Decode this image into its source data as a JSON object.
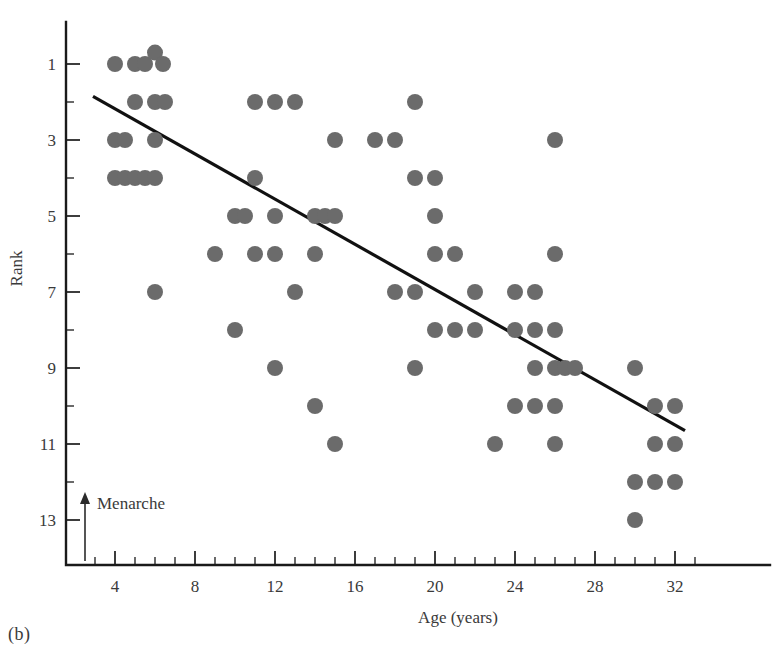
{
  "figure": {
    "panel_caption": "(b)",
    "annotation": {
      "label": "Menarche",
      "age_value": 2.5
    }
  },
  "chart_data": {
    "type": "scatter",
    "title": "",
    "xlabel": "Age (years)",
    "ylabel": "Rank",
    "xlim": [
      1,
      34
    ],
    "ylim": [
      0.2,
      14.2
    ],
    "y_inverted": true,
    "grid": false,
    "legend": null,
    "x_ticks_major": [
      4,
      8,
      12,
      16,
      20,
      24,
      28,
      32
    ],
    "x_ticks_minor": [
      3,
      5,
      6,
      7,
      9,
      10,
      11,
      13,
      14,
      15,
      17,
      18,
      19,
      21,
      22,
      23,
      25,
      26,
      27,
      29,
      30,
      31,
      33
    ],
    "x_tick_labels": [
      "4",
      "8",
      "12",
      "16",
      "20",
      "24",
      "28",
      "32"
    ],
    "y_ticks_major": [
      1,
      3,
      5,
      7,
      9,
      11,
      13
    ],
    "y_ticks_minor": [
      2,
      4,
      6,
      8,
      10,
      12
    ],
    "y_tick_labels": [
      "1",
      "3",
      "5",
      "7",
      "9",
      "11",
      "13"
    ],
    "marker": {
      "shape": "circle",
      "color": "#6b6b6b",
      "radius_px": 8
    },
    "trend_line": {
      "color": "#111111",
      "x_start": 2.9,
      "y_start": 1.85,
      "x_end": 32.5,
      "y_end": 10.65
    },
    "points": [
      {
        "age": 4,
        "rank": 1
      },
      {
        "age": 5,
        "rank": 1
      },
      {
        "age": 5.5,
        "rank": 1
      },
      {
        "age": 6,
        "rank": 0.7
      },
      {
        "age": 6.4,
        "rank": 1
      },
      {
        "age": 5,
        "rank": 2
      },
      {
        "age": 6,
        "rank": 2
      },
      {
        "age": 6.5,
        "rank": 2
      },
      {
        "age": 11,
        "rank": 2
      },
      {
        "age": 12,
        "rank": 2
      },
      {
        "age": 13,
        "rank": 2
      },
      {
        "age": 19,
        "rank": 2
      },
      {
        "age": 4,
        "rank": 3
      },
      {
        "age": 4.5,
        "rank": 3
      },
      {
        "age": 6,
        "rank": 3
      },
      {
        "age": 15,
        "rank": 3
      },
      {
        "age": 17,
        "rank": 3
      },
      {
        "age": 18,
        "rank": 3
      },
      {
        "age": 26,
        "rank": 3
      },
      {
        "age": 4,
        "rank": 4
      },
      {
        "age": 4.5,
        "rank": 4
      },
      {
        "age": 5,
        "rank": 4
      },
      {
        "age": 5.5,
        "rank": 4
      },
      {
        "age": 6,
        "rank": 4
      },
      {
        "age": 11,
        "rank": 4
      },
      {
        "age": 19,
        "rank": 4
      },
      {
        "age": 20,
        "rank": 4
      },
      {
        "age": 10,
        "rank": 5
      },
      {
        "age": 10.5,
        "rank": 5
      },
      {
        "age": 12,
        "rank": 5
      },
      {
        "age": 14,
        "rank": 5
      },
      {
        "age": 14.5,
        "rank": 5
      },
      {
        "age": 15,
        "rank": 5
      },
      {
        "age": 20,
        "rank": 5
      },
      {
        "age": 9,
        "rank": 6
      },
      {
        "age": 11,
        "rank": 6
      },
      {
        "age": 12,
        "rank": 6
      },
      {
        "age": 14,
        "rank": 6
      },
      {
        "age": 20,
        "rank": 6
      },
      {
        "age": 21,
        "rank": 6
      },
      {
        "age": 26,
        "rank": 6
      },
      {
        "age": 6,
        "rank": 7
      },
      {
        "age": 13,
        "rank": 7
      },
      {
        "age": 18,
        "rank": 7
      },
      {
        "age": 19,
        "rank": 7
      },
      {
        "age": 22,
        "rank": 7
      },
      {
        "age": 24,
        "rank": 7
      },
      {
        "age": 25,
        "rank": 7
      },
      {
        "age": 10,
        "rank": 8
      },
      {
        "age": 20,
        "rank": 8
      },
      {
        "age": 21,
        "rank": 8
      },
      {
        "age": 22,
        "rank": 8
      },
      {
        "age": 24,
        "rank": 8
      },
      {
        "age": 25,
        "rank": 8
      },
      {
        "age": 26,
        "rank": 8
      },
      {
        "age": 12,
        "rank": 9
      },
      {
        "age": 19,
        "rank": 9
      },
      {
        "age": 25,
        "rank": 9
      },
      {
        "age": 26,
        "rank": 9
      },
      {
        "age": 26.5,
        "rank": 9
      },
      {
        "age": 27,
        "rank": 9
      },
      {
        "age": 30,
        "rank": 9
      },
      {
        "age": 14,
        "rank": 10
      },
      {
        "age": 24,
        "rank": 10
      },
      {
        "age": 25,
        "rank": 10
      },
      {
        "age": 26,
        "rank": 10
      },
      {
        "age": 31,
        "rank": 10
      },
      {
        "age": 32,
        "rank": 10
      },
      {
        "age": 15,
        "rank": 11
      },
      {
        "age": 23,
        "rank": 11
      },
      {
        "age": 26,
        "rank": 11
      },
      {
        "age": 31,
        "rank": 11
      },
      {
        "age": 32,
        "rank": 11
      },
      {
        "age": 30,
        "rank": 12
      },
      {
        "age": 31,
        "rank": 12
      },
      {
        "age": 32,
        "rank": 12
      },
      {
        "age": 30,
        "rank": 13
      }
    ]
  }
}
